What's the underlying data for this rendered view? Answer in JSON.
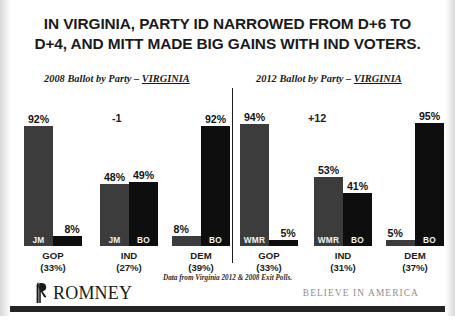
{
  "slide": {
    "title_line1": "IN VIRGINIA, PARTY ID NARROWED FROM D+6 TO",
    "title_line2": "D+4, AND MITT MADE BIG GAINS WITH IND VOTERS.",
    "source_note": "Data from Virginia 2012 & 2008 Exit Polls.",
    "logo_word": "ROMNEY",
    "tagline": "BELIEVE IN AMERICA",
    "accent_gray": "#3c3c3c",
    "accent_black": "#0e0e0e"
  },
  "charts": {
    "left": {
      "caption_prefix": "2008 Ballot by Party – ",
      "caption_state": "VIRGINIA",
      "annotation": "-1",
      "groups": [
        {
          "name": "GOP",
          "share": "(33%)",
          "bars": [
            {
              "tag": "JM",
              "value": "92%",
              "pct": 92,
              "party": "rep"
            },
            {
              "tag": "BO",
              "value": "8%",
              "pct": 8,
              "party": "dem"
            }
          ]
        },
        {
          "name": "IND",
          "share": "(27%)",
          "bars": [
            {
              "tag": "JM",
              "value": "48%",
              "pct": 48,
              "party": "rep"
            },
            {
              "tag": "BO",
              "value": "49%",
              "pct": 49,
              "party": "dem"
            }
          ]
        },
        {
          "name": "DEM",
          "share": "(39%)",
          "bars": [
            {
              "tag": "JM",
              "value": "8%",
              "pct": 8,
              "party": "rep"
            },
            {
              "tag": "BO",
              "value": "92%",
              "pct": 92,
              "party": "dem"
            }
          ]
        }
      ]
    },
    "right": {
      "caption_prefix": "2012 Ballot by Party – ",
      "caption_state": "VIRGINIA",
      "annotation": "+12",
      "groups": [
        {
          "name": "GOP",
          "share": "(33%)",
          "bars": [
            {
              "tag": "WMR",
              "value": "94%",
              "pct": 94,
              "party": "rep"
            },
            {
              "tag": "",
              "value": "5%",
              "pct": 5,
              "party": "dem"
            }
          ]
        },
        {
          "name": "IND",
          "share": "(31%)",
          "bars": [
            {
              "tag": "WMR",
              "value": "53%",
              "pct": 53,
              "party": "rep"
            },
            {
              "tag": "BO",
              "value": "41%",
              "pct": 41,
              "party": "dem"
            }
          ]
        },
        {
          "name": "DEM",
          "share": "(37%)",
          "bars": [
            {
              "tag": "",
              "value": "5%",
              "pct": 5,
              "party": "rep"
            },
            {
              "tag": "BO",
              "value": "95%",
              "pct": 95,
              "party": "dem"
            }
          ]
        }
      ]
    }
  },
  "chart_data": {
    "type": "bar",
    "title": "IN VIRGINIA, PARTY ID NARROWED FROM D+6 TO D+4, AND MITT MADE BIG GAINS WITH IND VOTERS.",
    "xlabel": "",
    "ylabel": "",
    "ylim": [
      0,
      100
    ],
    "grid": false,
    "legend_position": "in-bar",
    "panels": [
      {
        "panel": "2008 Ballot by Party – VIRGINIA",
        "categories": [
          "GOP (33%)",
          "IND (27%)",
          "DEM (39%)"
        ],
        "series": [
          {
            "name": "JM",
            "values": [
              92,
              48,
              8
            ]
          },
          {
            "name": "BO",
            "values": [
              8,
              49,
              92
            ]
          }
        ],
        "annotations": [
          {
            "text": "-1",
            "category": "IND (27%)"
          }
        ]
      },
      {
        "panel": "2012 Ballot by Party – VIRGINIA",
        "categories": [
          "GOP (33%)",
          "IND (31%)",
          "DEM (37%)"
        ],
        "series": [
          {
            "name": "WMR",
            "values": [
              94,
              53,
              5
            ]
          },
          {
            "name": "BO",
            "values": [
              5,
              41,
              95
            ]
          }
        ],
        "annotations": [
          {
            "text": "+12",
            "category": "IND (31%)"
          }
        ]
      }
    ],
    "source": "Data from Virginia 2012 & 2008 Exit Polls."
  }
}
